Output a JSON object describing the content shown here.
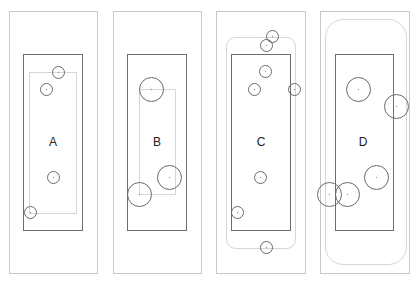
{
  "colors": {
    "outer_border": "#c8c8c8",
    "inner_border": "#6e6e6e",
    "boundary": "#d6d6d6",
    "circle": "#6a6a6a",
    "label": "#222222"
  },
  "panels": [
    {
      "label": "A",
      "label_pos": [
        53,
        142
      ],
      "outer": {
        "x": 9,
        "y": 11,
        "w": 88,
        "h": 262
      },
      "inner": {
        "x": 23,
        "y": 54,
        "w": 59,
        "h": 176
      },
      "boundary": {
        "type": "rect",
        "x": 29,
        "y": 72,
        "w": 47,
        "h": 141,
        "rx": 0
      },
      "circles": [
        {
          "cx": 58,
          "cy": 72,
          "r": 6
        },
        {
          "cx": 46,
          "cy": 89,
          "r": 6
        },
        {
          "cx": 53,
          "cy": 177,
          "r": 6
        },
        {
          "cx": 30,
          "cy": 212,
          "r": 6
        }
      ]
    },
    {
      "label": "B",
      "label_pos": [
        157,
        142
      ],
      "outer": {
        "x": 113,
        "y": 11,
        "w": 88,
        "h": 262
      },
      "inner": {
        "x": 127,
        "y": 54,
        "w": 59,
        "h": 176
      },
      "boundary": {
        "type": "rect",
        "x": 139,
        "y": 89,
        "w": 36,
        "h": 105,
        "rx": 0
      },
      "circles": [
        {
          "cx": 151,
          "cy": 89,
          "r": 12
        },
        {
          "cx": 169,
          "cy": 177,
          "r": 12
        },
        {
          "cx": 139,
          "cy": 194,
          "r": 12
        }
      ]
    },
    {
      "label": "C",
      "label_pos": [
        261,
        142
      ],
      "outer": {
        "x": 216,
        "y": 11,
        "w": 89,
        "h": 262
      },
      "inner": {
        "x": 231,
        "y": 54,
        "w": 59,
        "h": 176
      },
      "boundary": {
        "type": "rect",
        "x": 226,
        "y": 37,
        "w": 69,
        "h": 211,
        "rx": 9
      },
      "circles": [
        {
          "cx": 272,
          "cy": 36,
          "r": 6
        },
        {
          "cx": 266,
          "cy": 45,
          "r": 6
        },
        {
          "cx": 265,
          "cy": 71,
          "r": 6
        },
        {
          "cx": 254,
          "cy": 89,
          "r": 6
        },
        {
          "cx": 294,
          "cy": 89,
          "r": 6
        },
        {
          "cx": 260,
          "cy": 177,
          "r": 6
        },
        {
          "cx": 237,
          "cy": 212,
          "r": 6
        },
        {
          "cx": 266,
          "cy": 247,
          "r": 6
        }
      ]
    },
    {
      "label": "D",
      "label_pos": [
        363,
        142
      ],
      "outer": {
        "x": 320,
        "y": 11,
        "w": 89,
        "h": 262
      },
      "inner": {
        "x": 335,
        "y": 54,
        "w": 58,
        "h": 176
      },
      "boundary": {
        "type": "rect",
        "x": 325,
        "y": 19,
        "w": 81,
        "h": 245,
        "rx": 18
      },
      "circles": [
        {
          "cx": 358,
          "cy": 89,
          "r": 12
        },
        {
          "cx": 396,
          "cy": 106,
          "r": 12
        },
        {
          "cx": 376,
          "cy": 177,
          "r": 12
        },
        {
          "cx": 329,
          "cy": 194,
          "r": 12
        },
        {
          "cx": 347,
          "cy": 194,
          "r": 12
        }
      ]
    }
  ]
}
